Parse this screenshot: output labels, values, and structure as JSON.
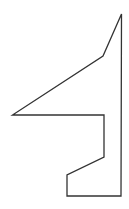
{
  "diagram": {
    "type": "polygon-outline",
    "background": "#ffffff",
    "stroke": "#333333",
    "stroke_width": 1.3,
    "fill": "none",
    "points": [
      [
        121.5,
        14
      ],
      [
        103,
        56
      ],
      [
        12.5,
        115
      ],
      [
        104,
        115
      ],
      [
        104,
        157
      ],
      [
        67,
        175
      ],
      [
        67,
        196
      ],
      [
        121,
        196
      ]
    ]
  }
}
